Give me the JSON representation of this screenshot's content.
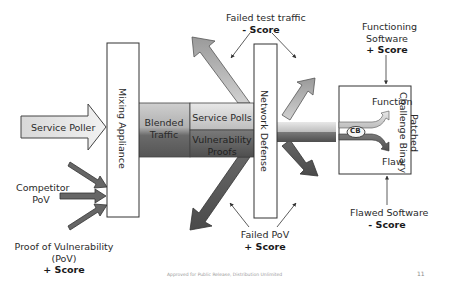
{
  "diagram": {
    "nodes": {
      "service_poller": "Service Poller",
      "mixing_appliance": "Mixing Appliance",
      "blended_traffic_line1": "Blended",
      "blended_traffic_line2": "Traffic",
      "service_polls": "Service Polls",
      "vulnerability_proofs_line1": "Vulnerability",
      "vulnerability_proofs_line2": "Proofs",
      "network_defense": "Network Defense",
      "patched_cb_line1": "Patched",
      "patched_cb_line2": "Challenge Binary",
      "cb": "CB",
      "function": "Function",
      "flaw": "Flaw"
    },
    "annotations": {
      "competitor_pov_line1": "Competitor",
      "competitor_pov_line2": "PoV",
      "pov_line1": "Proof of Vulnerability",
      "pov_line2": "(PoV)",
      "pov_score": "+ Score",
      "failed_test_traffic": "Failed test traffic",
      "failed_test_score": "- Score",
      "functioning_line1": "Functioning",
      "functioning_line2": "Software",
      "functioning_score": "+ Score",
      "failed_pov": "Failed PoV",
      "failed_pov_score": "+ Score",
      "flawed_software": "Flawed Software",
      "flawed_score": "- Score"
    },
    "colors": {
      "light_arrow": "#b8b8b8",
      "dark_arrow": "#5a5a5a",
      "box_border": "#333333"
    }
  },
  "footer": {
    "text": "Approved for Public Release, Distribution Unlimited",
    "page_number": "11"
  }
}
